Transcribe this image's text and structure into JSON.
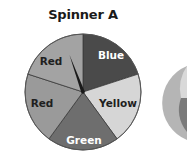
{
  "title": "Spinner A",
  "spinner": {
    "center": [
      83,
      92
    ],
    "radius": 58,
    "sectors": [
      {
        "label": "Blue",
        "start_deg": 0,
        "end_deg": 72,
        "fill": "#4a4a4a",
        "text_color": "#ffffff",
        "label_pos": [
          111,
          56
        ]
      },
      {
        "label": "Yellow",
        "start_deg": 72,
        "end_deg": 144,
        "fill": "#d6d6d6",
        "text_color": "#1f1f1f",
        "label_pos": [
          118,
          104
        ]
      },
      {
        "label": "Green",
        "start_deg": 144,
        "end_deg": 216,
        "fill": "#6e6e6e",
        "text_color": "#ffffff",
        "label_pos": [
          84,
          141
        ]
      },
      {
        "label": "Red",
        "start_deg": 216,
        "end_deg": 288,
        "fill": "#9a9a9a",
        "text_color": "#1f1f1f",
        "label_pos": [
          42,
          104
        ]
      },
      {
        "label": "Red",
        "start_deg": 288,
        "end_deg": 360,
        "fill": "#a3a3a3",
        "text_color": "#1f1f1f",
        "label_pos": [
          51,
          62
        ]
      }
    ],
    "needle": {
      "angle_deg": -20,
      "length": 40,
      "color": "#1a1a1a"
    }
  },
  "partial_spinner_right": {
    "visible": true
  }
}
